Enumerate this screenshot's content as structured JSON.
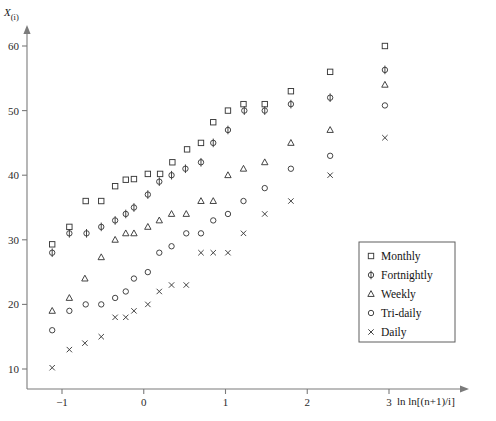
{
  "chart_data": {
    "type": "scatter",
    "title": "",
    "xlabel": "ln ln[(n+1)/i]",
    "ylabel": "X(i)",
    "ylabel_main": "X",
    "ylabel_sub": "(i)",
    "xlim": [
      -1.35,
      3.45
    ],
    "ylim": [
      7.5,
      62
    ],
    "xticks": [
      -1,
      0,
      1,
      2,
      3
    ],
    "xtick_labels": [
      "−1",
      "0",
      "1",
      "2",
      "3"
    ],
    "yticks": [
      10,
      20,
      30,
      40,
      50,
      60
    ],
    "ytick_labels": [
      "10",
      "20",
      "30",
      "40",
      "50",
      "60"
    ],
    "grid": false,
    "legend_position": "center-right",
    "marker_color": "#3a3a3a",
    "axis_color": "#7b7b7b",
    "series": [
      {
        "name": "Monthly",
        "marker": "square",
        "x": [
          -1.12,
          -0.91,
          -0.71,
          -0.52,
          -0.35,
          -0.22,
          -0.12,
          0.05,
          0.2,
          0.35,
          0.53,
          0.7,
          0.85,
          1.03,
          1.22,
          1.48,
          1.8,
          2.28,
          2.95
        ],
        "y": [
          29.3,
          32.0,
          36.0,
          36.0,
          38.3,
          39.3,
          39.4,
          40.2,
          40.2,
          42.0,
          44.0,
          45.0,
          48.2,
          50.0,
          51.0,
          51.0,
          53.0,
          56.0,
          60.0
        ]
      },
      {
        "name": "Fortnightly",
        "marker": "circle-bar",
        "x": [
          -1.12,
          -0.91,
          -0.7,
          -0.52,
          -0.35,
          -0.22,
          -0.12,
          0.05,
          0.19,
          0.34,
          0.51,
          0.7,
          0.85,
          1.03,
          1.23,
          1.48,
          1.8,
          2.28,
          2.95
        ],
        "y": [
          28.0,
          31.0,
          31.0,
          32.0,
          33.0,
          34.0,
          35.0,
          37.0,
          39.0,
          40.0,
          41.0,
          42.0,
          45.0,
          47.0,
          50.0,
          50.0,
          51.0,
          52.0,
          56.3
        ]
      },
      {
        "name": "Weekly",
        "marker": "triangle",
        "x": [
          -1.12,
          -0.91,
          -0.72,
          -0.52,
          -0.35,
          -0.22,
          -0.12,
          0.05,
          0.19,
          0.34,
          0.52,
          0.7,
          0.85,
          1.03,
          1.22,
          1.48,
          1.8,
          2.28,
          2.95
        ],
        "y": [
          19.0,
          21.0,
          24.0,
          27.3,
          30.0,
          31.0,
          31.0,
          32.0,
          33.0,
          34.0,
          34.0,
          36.0,
          36.0,
          40.0,
          41.0,
          42.0,
          45.0,
          47.0,
          54.0
        ]
      },
      {
        "name": "Tri-daily",
        "marker": "circle",
        "x": [
          -1.12,
          -0.91,
          -0.71,
          -0.52,
          -0.35,
          -0.22,
          -0.12,
          0.05,
          0.19,
          0.34,
          0.52,
          0.7,
          0.85,
          1.03,
          1.22,
          1.48,
          1.8,
          2.28,
          2.95
        ],
        "y": [
          16.0,
          19.0,
          20.0,
          20.0,
          21.0,
          22.0,
          24.0,
          25.0,
          28.0,
          29.0,
          31.0,
          31.0,
          33.0,
          34.0,
          36.0,
          38.0,
          41.0,
          43.0,
          50.8
        ]
      },
      {
        "name": "Daily",
        "marker": "cross",
        "x": [
          -1.12,
          -0.91,
          -0.72,
          -0.52,
          -0.35,
          -0.22,
          -0.12,
          0.05,
          0.19,
          0.34,
          0.52,
          0.7,
          0.85,
          1.03,
          1.22,
          1.48,
          1.8,
          2.28,
          2.95
        ],
        "y": [
          10.2,
          13.0,
          14.0,
          15.0,
          18.0,
          18.0,
          19.0,
          20.0,
          22.0,
          23.0,
          23.0,
          28.0,
          28.0,
          28.0,
          31.0,
          34.0,
          36.0,
          40.0,
          45.8
        ]
      }
    ],
    "legend": [
      {
        "label": "Monthly",
        "marker": "square"
      },
      {
        "label": "Fortnightly",
        "marker": "circle-bar"
      },
      {
        "label": "Weekly",
        "marker": "triangle"
      },
      {
        "label": "Tri-daily",
        "marker": "circle"
      },
      {
        "label": "Daily",
        "marker": "cross"
      }
    ]
  }
}
